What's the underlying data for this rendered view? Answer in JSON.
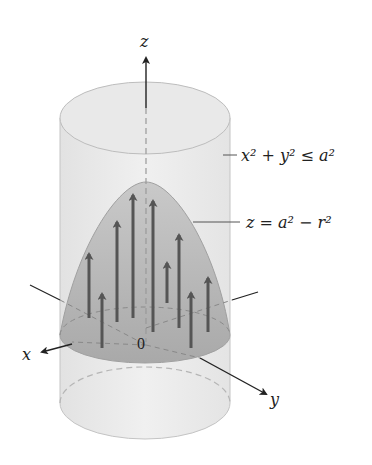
{
  "diagram": {
    "type": "3d-vector-field-over-paraboloid",
    "axes": {
      "z_label": "z",
      "x_label": "x",
      "y_label": "y",
      "origin_label": "0"
    },
    "annotations": {
      "cylinder_label": "x² + y² ≤ a²",
      "paraboloid_label": "z = a² − r²"
    },
    "colors": {
      "cylinder_fill": "#ececec",
      "cylinder_edge": "#bdbdbd",
      "paraboloid_fill": "#b8b8b8",
      "arrow_color": "#555555",
      "axis_color": "#222222"
    }
  }
}
